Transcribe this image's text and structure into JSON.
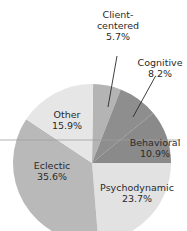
{
  "chart_data": {
    "type": "pie",
    "title": "",
    "categories": [
      "Client-centered",
      "Cognitive",
      "Behavioral",
      "Psychodynamic",
      "Eclectic",
      "Other"
    ],
    "values": [
      5.7,
      8.2,
      10.9,
      23.7,
      35.6,
      15.9
    ],
    "unit": "%",
    "start_angle_deg": 0.8,
    "direction": "clockwise",
    "colors": [
      "#b4b4b4",
      "#8e8e8e",
      "#8a8a8a",
      "#e2e2e2",
      "#b9b9b9",
      "#e6e6e6"
    ],
    "labels": [
      {
        "name": "Client-",
        "name2": "centered",
        "pct": "5.7%",
        "x": 118,
        "y": 9,
        "leader": [
          117,
          56,
          108,
          107
        ]
      },
      {
        "name": "Cognitive",
        "name2": "",
        "pct": "8.2%",
        "x": 160,
        "y": 57,
        "leader": [
          155,
          77,
          133,
          117
        ]
      },
      {
        "name": "Behavioral",
        "name2": "",
        "pct": "10.9%",
        "x": 155,
        "y": 137,
        "leader": null
      },
      {
        "name": "Psychodynamic",
        "name2": "",
        "pct": "23.7%",
        "x": 137,
        "y": 182,
        "leader": null
      },
      {
        "name": "Eclectic",
        "name2": "",
        "pct": "35.6%",
        "x": 52,
        "y": 160,
        "leader": null
      },
      {
        "name": "Other",
        "name2": "",
        "pct": "15.9%",
        "x": 67,
        "y": 109,
        "leader": null
      }
    ],
    "legend": "none"
  },
  "geometry": {
    "cx": 92,
    "cy": 163,
    "r": 79
  },
  "rule_line": {
    "x1": 0,
    "y1": 140,
    "x2": 180,
    "y2": 140,
    "color": "#a0a0a0"
  }
}
